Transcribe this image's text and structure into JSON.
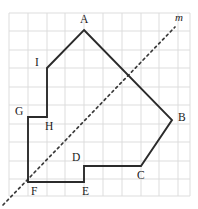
{
  "figure": {
    "caption": "",
    "background_color": "#ffffff"
  },
  "chart_data": {
    "type": "diagram",
    "title": "",
    "subtitle": "",
    "xlabel": "",
    "ylabel": "",
    "grid": {
      "visible": true,
      "columns": 10,
      "rows": 10,
      "cell_size_px": 19,
      "origin_px": [
        9,
        13
      ],
      "extent_px": [
        190,
        196
      ],
      "line_color": "#d9d9d9"
    },
    "polygon": {
      "name": "ABCDEFGHI",
      "closed": true,
      "sides": 9,
      "stroke_color": "#2b2b2b",
      "fill": "none",
      "vertex_order": [
        "A",
        "B",
        "C",
        "D",
        "E",
        "F",
        "G",
        "H",
        "I"
      ],
      "vertices_px": {
        "A": [
          84,
          30
        ],
        "B": [
          172,
          120
        ],
        "C": [
          141,
          166
        ],
        "D": [
          84,
          166
        ],
        "E": [
          84,
          182
        ],
        "F": [
          28,
          182
        ],
        "G": [
          28,
          117
        ],
        "H": [
          47,
          117
        ],
        "I": [
          47,
          68
        ]
      },
      "vertices_grid": {
        "A": [
          4,
          9
        ],
        "B": [
          8.6,
          4
        ],
        "C": [
          7,
          1.6
        ],
        "D": [
          4,
          1.6
        ],
        "E": [
          4,
          0.75
        ],
        "F": [
          1,
          0.75
        ],
        "G": [
          1,
          4.15
        ],
        "H": [
          2,
          4.15
        ],
        "I": [
          2,
          6.75
        ]
      }
    },
    "mirror_line": {
      "label": "m",
      "style": "dashed",
      "stroke_color": "#3a3a3a",
      "start_px": [
        3,
        205
      ],
      "end_px": [
        175,
        27
      ],
      "passes_through": [
        "F"
      ],
      "slope": -1
    },
    "labels": [
      {
        "text": "A",
        "vertex": "A",
        "x": 80,
        "y": 14
      },
      {
        "text": "B",
        "vertex": "B",
        "x": 178,
        "y": 112
      },
      {
        "text": "C",
        "vertex": "C",
        "x": 137,
        "y": 170
      },
      {
        "text": "D",
        "vertex": "D",
        "x": 72,
        "y": 152
      },
      {
        "text": "E",
        "vertex": "E",
        "x": 82,
        "y": 186
      },
      {
        "text": "F",
        "vertex": "F",
        "x": 31,
        "y": 186
      },
      {
        "text": "G",
        "vertex": "G",
        "x": 15,
        "y": 106
      },
      {
        "text": "H",
        "vertex": "H",
        "x": 45,
        "y": 121
      },
      {
        "text": "I",
        "vertex": "I",
        "x": 35,
        "y": 57
      },
      {
        "text": "m",
        "vertex": "line-m",
        "x": 175,
        "y": 12
      }
    ]
  }
}
